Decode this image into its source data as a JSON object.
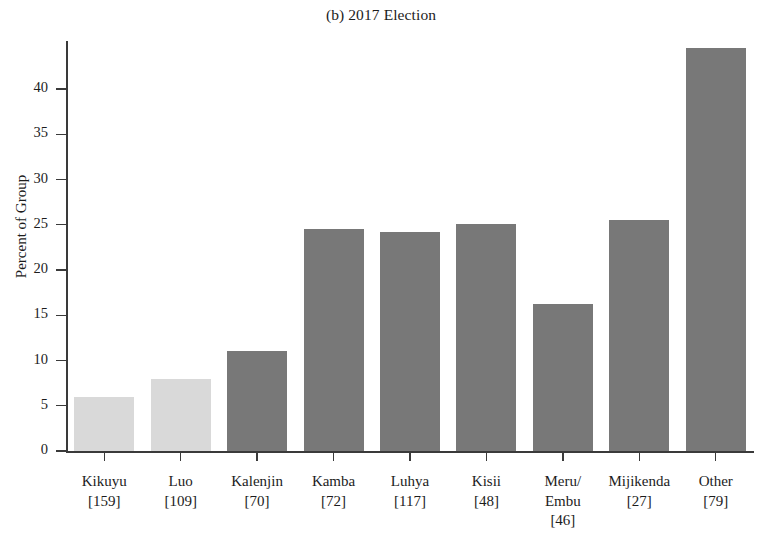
{
  "chart_data": {
    "type": "bar",
    "title": "(b) 2017 Election",
    "xlabel": "",
    "ylabel": "Percent of Group",
    "ylim": [
      0,
      45
    ],
    "yticks": [
      0,
      5,
      10,
      15,
      20,
      25,
      30,
      35,
      40
    ],
    "ytick_labels": [
      "0",
      "5",
      "10",
      "15",
      "20",
      "25",
      "30",
      "35",
      "40"
    ],
    "grid": false,
    "legend": "none",
    "categories": [
      "Kikuyu",
      "Luo",
      "Kalenjin",
      "Kamba",
      "Luhya",
      "Kisii",
      "Meru/\nEmbu",
      "Mijikenda",
      "Other"
    ],
    "category_labels": [
      {
        "name": "Kikuyu",
        "count": "[159]",
        "n": 159
      },
      {
        "name": "Luo",
        "count": "[109]",
        "n": 109
      },
      {
        "name": "Kalenjin",
        "count": "[70]",
        "n": 70
      },
      {
        "name": "Kamba",
        "count": "[72]",
        "n": 72
      },
      {
        "name": "Luhya",
        "count": "[117]",
        "n": 117
      },
      {
        "name": "Kisii",
        "count": "[48]",
        "n": 48
      },
      {
        "name": "Meru/ Embu",
        "count": "[46]",
        "n": 46
      },
      {
        "name": "Mijikenda",
        "count": "[27]",
        "n": 27
      },
      {
        "name": "Other",
        "count": "[79]",
        "n": 79
      }
    ],
    "values": [
      6.0,
      8.0,
      11.0,
      24.5,
      24.2,
      25.1,
      16.3,
      25.5,
      44.5
    ],
    "bar_colors": [
      "#d9d9d9",
      "#d9d9d9",
      "#787878",
      "#787878",
      "#787878",
      "#787878",
      "#787878",
      "#787878",
      "#787878"
    ],
    "colors": {
      "light_bar": "#d9d9d9",
      "dark_bar": "#787878",
      "axis": "#3a3a3a",
      "text": "#1c1c1c",
      "background": "#ffffff"
    }
  }
}
